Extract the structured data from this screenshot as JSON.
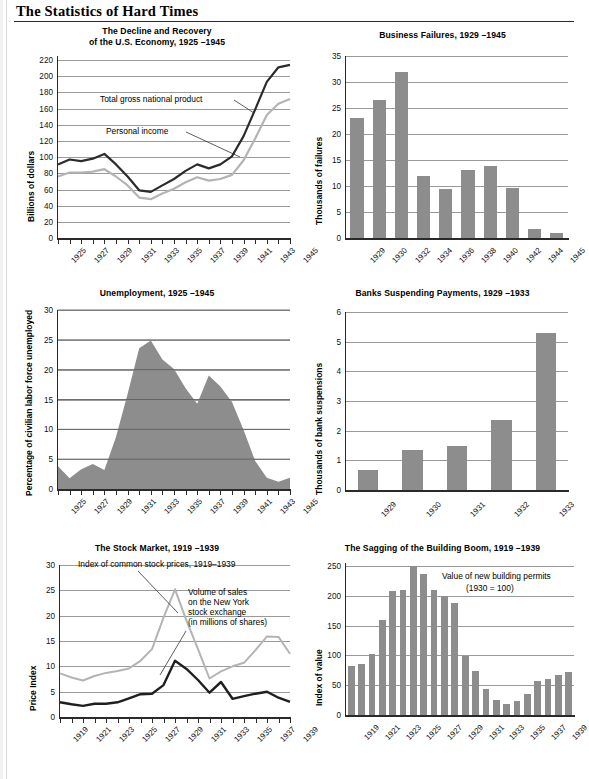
{
  "page": {
    "title": "The Statistics of Hard Times"
  },
  "charts": [
    {
      "id": "gnp",
      "title_lines": [
        "The Decline and Recovery",
        "of the U.S. Economy, 1925 –1945"
      ],
      "ylabel": "Billions of dollars",
      "yticks": [
        0,
        20,
        40,
        60,
        80,
        100,
        120,
        140,
        160,
        180,
        200,
        220
      ],
      "xticks": [
        "1925",
        "1927",
        "1929",
        "1931",
        "1933",
        "1935",
        "1937",
        "1939",
        "1941",
        "1943",
        "1945"
      ],
      "annotations": [
        "Total gross national product",
        "Personal income"
      ],
      "chart_data": {
        "type": "line",
        "title": "The Decline and Recovery of the U.S. Economy, 1925 –1945",
        "xlabel": "",
        "ylabel": "Billions of dollars",
        "ylim": [
          0,
          225
        ],
        "grid": true,
        "x": [
          1925,
          1926,
          1927,
          1928,
          1929,
          1930,
          1931,
          1932,
          1933,
          1934,
          1935,
          1936,
          1937,
          1938,
          1939,
          1940,
          1941,
          1942,
          1943,
          1944,
          1945
        ],
        "series": [
          {
            "name": "Total gross national product",
            "color": "#2b2b2b",
            "values": [
              91,
              97,
              95,
              98,
              104,
              91,
              76,
              59,
              57,
              65,
              73,
              83,
              91,
              86,
              91,
              101,
              126,
              159,
              193,
              211,
              214
            ]
          },
          {
            "name": "Personal income",
            "color": "#b4b4b4",
            "values": [
              76,
              81,
              81,
              82,
              85,
              76,
              65,
              50,
              48,
              55,
              61,
              69,
              75,
              71,
              73,
              78,
              96,
              123,
              152,
              166,
              172
            ]
          }
        ]
      }
    },
    {
      "id": "failures",
      "title_lines": [
        "Business Failures, 1929 –1945"
      ],
      "ylabel": "Thousands of failures",
      "yticks": [
        0,
        5,
        10,
        15,
        20,
        25,
        30,
        35
      ],
      "xticks": [
        "1929",
        "1930",
        "1932",
        "1934",
        "1936",
        "1938",
        "1940",
        "1942",
        "1944",
        "1945"
      ],
      "annotations": [],
      "chart_data": {
        "type": "bar",
        "title": "Business Failures, 1929 –1945",
        "xlabel": "",
        "ylabel": "Thousands of failures",
        "ylim": [
          0,
          35
        ],
        "grid": true,
        "categories": [
          "1929",
          "1930",
          "1932",
          "1934",
          "1936",
          "1938",
          "1940",
          "1942",
          "1944",
          "1945"
        ],
        "values": [
          23.0,
          26.5,
          32.0,
          12.0,
          9.5,
          13.0,
          13.9,
          9.7,
          1.8,
          0.9
        ]
      }
    },
    {
      "id": "unemployment",
      "title_lines": [
        "Unemployment, 1925 –1945"
      ],
      "ylabel": "Percentage of civilian labor force unemployed",
      "yticks": [
        0,
        5,
        10,
        15,
        20,
        25,
        30
      ],
      "xticks": [
        "1925",
        "1927",
        "1929",
        "1931",
        "1933",
        "1935",
        "1937",
        "1939",
        "1941",
        "1943",
        "1945"
      ],
      "annotations": [],
      "chart_data": {
        "type": "area",
        "title": "Unemployment, 1925 –1945",
        "xlabel": "",
        "ylabel": "Percentage of civilian labor force unemployed",
        "ylim": [
          0,
          30
        ],
        "grid": true,
        "x": [
          1925,
          1926,
          1927,
          1928,
          1929,
          1930,
          1931,
          1932,
          1933,
          1934,
          1935,
          1936,
          1937,
          1938,
          1939,
          1940,
          1941,
          1942,
          1943,
          1944,
          1945
        ],
        "values": [
          3.8,
          1.8,
          3.3,
          4.2,
          3.2,
          8.7,
          15.9,
          23.6,
          24.9,
          21.7,
          20.1,
          16.9,
          14.3,
          19.0,
          17.2,
          14.6,
          9.9,
          4.7,
          1.9,
          1.2,
          1.9
        ]
      }
    },
    {
      "id": "banks",
      "title_lines": [
        "Banks Suspending Payments, 1929 –1933"
      ],
      "ylabel": "Thousands of bank suspensions",
      "yticks": [
        0,
        1,
        2,
        3,
        4,
        5,
        6
      ],
      "xticks": [
        "1929",
        "1930",
        "1931",
        "1932",
        "1933"
      ],
      "annotations": [],
      "chart_data": {
        "type": "bar",
        "title": "Banks Suspending Payments, 1929 –1933",
        "xlabel": "",
        "ylabel": "Thousands of bank suspensions",
        "ylim": [
          0,
          6
        ],
        "grid": true,
        "categories": [
          "1929",
          "1930",
          "1931",
          "1932",
          "1933"
        ],
        "values": [
          0.66,
          1.35,
          1.49,
          2.36,
          5.28
        ]
      }
    },
    {
      "id": "stocks",
      "title_lines": [
        "The Stock Market, 1919 –1939"
      ],
      "ylabel": "Price Index",
      "yticks": [
        0,
        5,
        10,
        15,
        20,
        25,
        30
      ],
      "xticks": [
        "1919",
        "1921",
        "1923",
        "1925",
        "1927",
        "1929",
        "1931",
        "1933",
        "1935",
        "1937",
        "1939"
      ],
      "annotations": [
        "Index of common stock prices, 1919–1939",
        "Volume of sales",
        "on the New York",
        "stock exchange",
        "(in millions of shares)"
      ],
      "chart_data": {
        "type": "line",
        "title": "The Stock Market, 1919 –1939",
        "xlabel": "",
        "ylabel": "Price Index",
        "ylim": [
          0,
          30
        ],
        "grid": true,
        "x": [
          1919,
          1920,
          1921,
          1922,
          1923,
          1924,
          1925,
          1926,
          1927,
          1928,
          1929,
          1930,
          1931,
          1932,
          1933,
          1934,
          1935,
          1936,
          1937,
          1938,
          1939
        ],
        "series": [
          {
            "name": "Volume of sales on the New York stock exchange (in millions of shares)",
            "color": "#b4b4b4",
            "values": [
              8.6,
              7.8,
              7.2,
              8.1,
              8.7,
              9.1,
              9.6,
              11.1,
              13.4,
              19.6,
              25.2,
              19.0,
              13.4,
              7.6,
              9.0,
              10.0,
              10.7,
              13.2,
              15.9,
              15.8,
              12.5
            ]
          },
          {
            "name": "Index of common stock prices, 1919–1939",
            "color": "#1f1f1f",
            "values": [
              2.9,
              2.5,
              2.2,
              2.6,
              2.6,
              2.9,
              3.7,
              4.5,
              4.6,
              6.3,
              11.1,
              9.5,
              7.3,
              4.8,
              6.9,
              3.6,
              4.1,
              4.6,
              5.0,
              3.8,
              3.0
            ]
          }
        ]
      }
    },
    {
      "id": "building",
      "title_lines": [
        "The Sagging of the Building Boom, 1919 –1939"
      ],
      "ylabel": "Index of value",
      "yticks": [
        0,
        50,
        100,
        150,
        200,
        250
      ],
      "xticks": [
        "1919",
        "1921",
        "1923",
        "1925",
        "1927",
        "1929",
        "1931",
        "1933",
        "1935",
        "1937",
        "1939"
      ],
      "annotations": [
        "Value of new building permits",
        "(1930 = 100)"
      ],
      "chart_data": {
        "type": "bar",
        "title": "The Sagging of the Building Boom, 1919 –1939",
        "xlabel": "",
        "ylabel": "Index of value",
        "ylim": [
          0,
          250
        ],
        "grid": true,
        "categories": [
          "1919",
          "1920",
          "1921",
          "1922",
          "1923",
          "1924",
          "1925",
          "1926",
          "1927",
          "1928",
          "1929",
          "1930",
          "1931",
          "1932",
          "1933",
          "1934",
          "1935",
          "1936",
          "1937",
          "1938",
          "1939"
        ],
        "values": [
          83,
          86,
          102,
          160,
          208,
          210,
          250,
          237,
          210,
          200,
          188,
          99,
          74,
          43,
          25,
          19,
          24,
          35,
          57,
          61,
          67,
          73
        ]
      }
    }
  ],
  "colors": {
    "bar_gray": "#8d8d8d",
    "dark_line": "#1f1f1f",
    "light_line": "#b4b4b4",
    "gridline": "#9a9a9a",
    "axis": "#2a2a2a"
  }
}
